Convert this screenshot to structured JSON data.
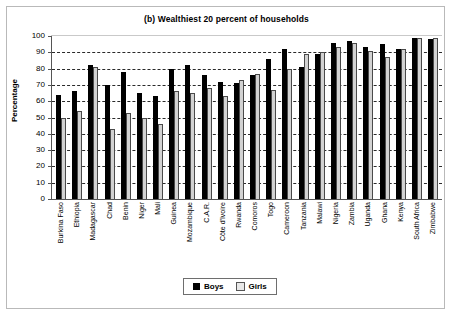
{
  "chart_data": {
    "type": "bar",
    "title": "(b) Wealthiest 20 percent of households",
    "xlabel": "",
    "ylabel": "Percentage",
    "ylim": [
      0,
      100
    ],
    "ytick_step": 10,
    "yticks": [
      0,
      10,
      20,
      30,
      40,
      50,
      60,
      70,
      80,
      90,
      100
    ],
    "grid": "horizontal-dashed",
    "legend_position": "bottom-center",
    "categories": [
      "Burkina Faso",
      "Ethiopia",
      "Madagascar",
      "Chad",
      "Benin",
      "Niger",
      "Mali",
      "Guinea",
      "Mozambique",
      "C.A.R.",
      "Côte d'Ivoire",
      "Rwanda",
      "Comoros",
      "Togo",
      "Cameroon",
      "Tanzania",
      "Malawi",
      "Nigeria",
      "Zambia",
      "Uganda",
      "Ghana",
      "Kenya",
      "South Africa",
      "Zimbabwe"
    ],
    "series": [
      {
        "name": "Boys",
        "color": "#000000",
        "values": [
          64,
          66,
          82,
          70,
          78,
          65,
          63,
          80,
          82,
          76,
          72,
          71,
          76,
          86,
          92,
          81,
          89,
          96,
          97,
          93,
          95,
          92,
          99,
          98
        ]
      },
      {
        "name": "Girls",
        "color": "#d2d2d2",
        "values": [
          50,
          54,
          81,
          43,
          53,
          50,
          46,
          66,
          65,
          68,
          63,
          73,
          77,
          67,
          80,
          89,
          90,
          93,
          96,
          91,
          87,
          92,
          99,
          99
        ]
      }
    ]
  },
  "legend": {
    "items": [
      {
        "label": "Boys",
        "swatch": "boys-swatch"
      },
      {
        "label": "Girls",
        "swatch": "girls-swatch"
      }
    ]
  }
}
